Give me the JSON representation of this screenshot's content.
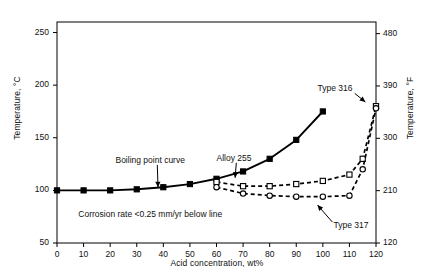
{
  "chart_data": {
    "type": "line",
    "title": "",
    "xlabel": "Acid concentration, wt%",
    "ylabel": "Temperature, °C",
    "ylabel_right": "Temperature, °F",
    "xlim": [
      0,
      120
    ],
    "ylim": [
      50,
      260
    ],
    "ylim_right": [
      120,
      500
    ],
    "grid": false,
    "legend": "none (inline annotations)",
    "xticks": [
      "0",
      "10",
      "20",
      "30",
      "40",
      "50",
      "60",
      "70",
      "80",
      "90",
      "100",
      "110",
      "120"
    ],
    "yticks_left": [
      "50",
      "100",
      "150",
      "200",
      "250"
    ],
    "yticks_right": [
      "120",
      "210",
      "300",
      "390",
      "480"
    ],
    "annotations": [
      {
        "text": "Boiling point curve",
        "x": 22,
        "y": 128,
        "arrow_to": {
          "x": 38,
          "y": 103
        }
      },
      {
        "text": "Alloy 255",
        "x": 60,
        "y": 130,
        "arrow_to": {
          "x": 67,
          "y": 112
        }
      },
      {
        "text": "Corrosion rate <0.25 mm/yr below line",
        "x": 8,
        "y": 77,
        "arrow_to": null
      },
      {
        "text": "Type 316",
        "x": 98,
        "y": 196,
        "arrow_to": {
          "x": 116,
          "y": 184
        }
      },
      {
        "text": "Type 317",
        "x": 104,
        "y": 66,
        "arrow_to": {
          "x": 98,
          "y": 86
        }
      }
    ],
    "series": [
      {
        "name": "Boiling point curve",
        "style": "solid",
        "marker": "filled-square",
        "x": [
          0,
          10,
          20,
          30,
          40,
          50,
          60,
          70,
          80,
          90,
          100
        ],
        "y": [
          100,
          100,
          100,
          101,
          103,
          106,
          111,
          118,
          130,
          148,
          175
        ]
      },
      {
        "name": "Alloy 255 upper branch",
        "style": "dashed",
        "marker": "open-square",
        "x": [
          60,
          70,
          80,
          90,
          100,
          110,
          115,
          120
        ],
        "y": [
          108,
          104,
          104,
          106,
          109,
          115,
          130,
          180
        ]
      },
      {
        "name": "Type 317 lower branch",
        "style": "dashed",
        "marker": "open-circle",
        "x": [
          60,
          70,
          80,
          90,
          100,
          110,
          115,
          120
        ],
        "y": [
          103,
          97,
          95,
          94,
          94,
          95,
          120,
          178
        ]
      }
    ]
  },
  "axes": {
    "left_title": "Temperature, °C",
    "right_title": "Temperature, °F",
    "bottom_title": "Acid concentration, wt%"
  },
  "labels": {
    "boiling_point": "Boiling point curve",
    "alloy255": "Alloy 255",
    "corrosion_note": "Corrosion rate <0.25 mm/yr below line",
    "type316": "Type 316",
    "type317": "Type 317"
  }
}
